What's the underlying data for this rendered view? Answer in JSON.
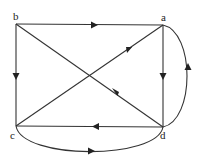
{
  "diagram": {
    "type": "directed-graph",
    "nodes": [
      {
        "id": "a",
        "label": "a"
      },
      {
        "id": "b",
        "label": "b"
      },
      {
        "id": "c",
        "label": "c"
      },
      {
        "id": "d",
        "label": "d"
      }
    ],
    "edges": [
      {
        "from": "b",
        "to": "a",
        "shape": "straight"
      },
      {
        "from": "b",
        "to": "c",
        "shape": "straight"
      },
      {
        "from": "b",
        "to": "d",
        "shape": "straight"
      },
      {
        "from": "c",
        "to": "a",
        "shape": "straight"
      },
      {
        "from": "a",
        "to": "d",
        "shape": "straight"
      },
      {
        "from": "d",
        "to": "c",
        "shape": "straight"
      },
      {
        "from": "d",
        "to": "a",
        "shape": "curved"
      },
      {
        "from": "c",
        "to": "d",
        "shape": "curved"
      }
    ]
  }
}
